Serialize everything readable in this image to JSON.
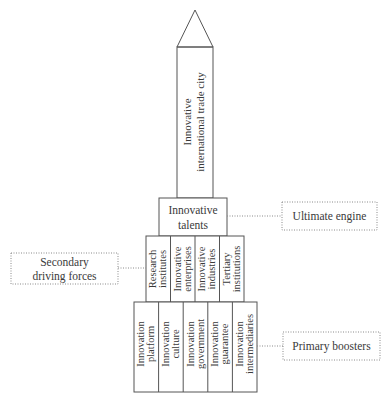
{
  "diagram": {
    "spire": {
      "lines": [
        "Innovative",
        "international trade  city"
      ]
    },
    "talents": {
      "lines": [
        "Innovative",
        "talents"
      ]
    },
    "secondary_tier": [
      {
        "lines": [
          "Research",
          "institutes"
        ]
      },
      {
        "lines": [
          "Innovative",
          "enterprises"
        ]
      },
      {
        "lines": [
          "Innovative",
          "industries"
        ]
      },
      {
        "lines": [
          "Tertiary",
          "institutions"
        ]
      }
    ],
    "primary_tier": [
      {
        "lines": [
          "Innovation",
          "platform"
        ]
      },
      {
        "lines": [
          "Innovation",
          "culture"
        ]
      },
      {
        "lines": [
          "Innovation",
          "government"
        ]
      },
      {
        "lines": [
          "Innovation",
          "guarantee"
        ]
      },
      {
        "lines": [
          "Innovation",
          "intermediaries"
        ]
      }
    ],
    "labels": {
      "ultimate": [
        "Ultimate engine"
      ],
      "secondary": [
        "Secondary",
        "driving forces"
      ],
      "primary": [
        "Primary boosters"
      ]
    },
    "colors": {
      "line": "#555555",
      "dotted": "#8a8a8a",
      "text": "#3a3a3a"
    }
  }
}
